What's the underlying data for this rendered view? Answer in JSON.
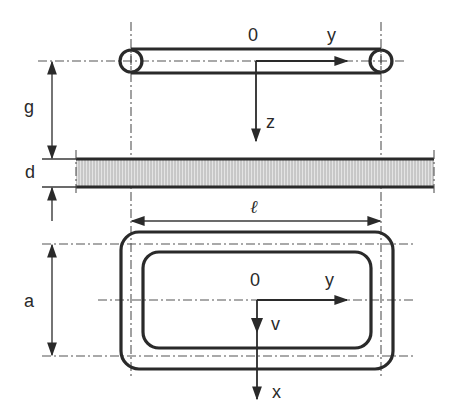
{
  "diagram": {
    "type": "technical-drawing",
    "side_view": {
      "origin_label": "0",
      "y_axis_label": "y",
      "z_axis_label": "z"
    },
    "dimensions": {
      "gap_label": "g",
      "thickness_label": "d",
      "length_label": "ℓ",
      "width_label": "a"
    },
    "plan_view": {
      "origin_label": "0",
      "y_axis_label": "y",
      "x_axis_label": "x",
      "velocity_label": "v"
    },
    "colors": {
      "line": "#2a2a2a",
      "hatch_fill": "#d8d8d8",
      "background": "#ffffff"
    }
  }
}
